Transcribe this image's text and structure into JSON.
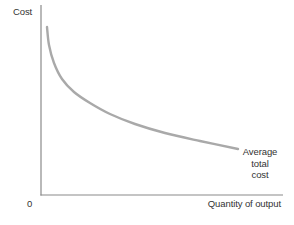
{
  "page": {
    "background": "#ffffff"
  },
  "chart": {
    "y_axis_label": "Cost",
    "x_axis_label": "Quantity of output",
    "origin_label": "0",
    "curve_label": {
      "lines": [
        "Average",
        "total",
        "cost"
      ]
    },
    "colors": {
      "curve": "#a9a9a9",
      "axis": "#8a8a8a",
      "text": "#333333",
      "background": "#ffffff"
    }
  },
  "chart_data": {
    "type": "line",
    "title": "",
    "xlabel": "Quantity of output",
    "ylabel": "Cost",
    "x_ticks": [
      "0"
    ],
    "y_ticks": [],
    "grid": false,
    "legend": "none (curve labeled inline at right end)",
    "axes_px": {
      "origin": [
        41,
        195
      ],
      "x_end": [
        283,
        195
      ],
      "y_top": [
        41,
        5
      ]
    },
    "series": [
      {
        "name": "Average total cost",
        "shape": "convex, monotonically decreasing (hyperbola-like): average total cost falls steeply at low output and flattens as quantity of output increases",
        "points_px": [
          [
            47,
            27
          ],
          [
            49,
            45
          ],
          [
            54,
            63
          ],
          [
            62,
            79
          ],
          [
            74,
            92
          ],
          [
            90,
            103
          ],
          [
            110,
            114
          ],
          [
            135,
            124
          ],
          [
            165,
            133
          ],
          [
            200,
            141
          ],
          [
            238,
            149
          ]
        ]
      }
    ]
  }
}
